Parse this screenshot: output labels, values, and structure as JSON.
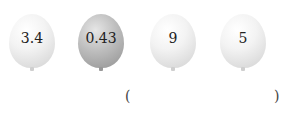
{
  "balloons": [
    {
      "value": "3.4",
      "shade": "light"
    },
    {
      "value": "0.43",
      "shade": "dark"
    },
    {
      "value": "9",
      "shade": "light"
    },
    {
      "value": "5",
      "shade": "light"
    }
  ],
  "answer": {
    "open": "(",
    "close": ")",
    "value": ""
  }
}
